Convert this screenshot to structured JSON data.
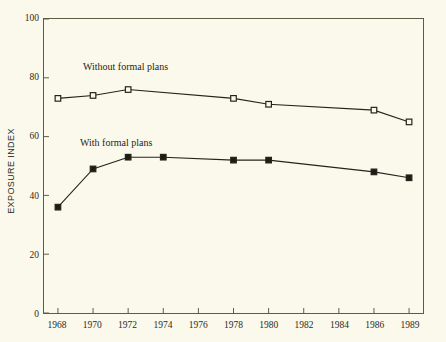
{
  "chart_data": {
    "type": "line",
    "title": "",
    "xlabel": "",
    "ylabel": "EXPOSURE INDEX",
    "xlim": [
      1968,
      1989
    ],
    "ylim": [
      0,
      100
    ],
    "grid": false,
    "legend_position": "inline-annotation",
    "x_tick_labels": [
      "1968",
      "1970",
      "1972",
      "1974",
      "1976",
      "1978",
      "1980",
      "1982",
      "1984",
      "1986",
      "1989"
    ],
    "y_tick_labels": [
      "0",
      "20",
      "40",
      "60",
      "80",
      "100"
    ],
    "y_ticks": [
      0,
      20,
      40,
      60,
      80,
      100
    ],
    "series": [
      {
        "name": "Without formal plans",
        "marker": "open-square",
        "x": [
          1968,
          1970,
          1972,
          1978,
          1980,
          1986,
          1989
        ],
        "values": [
          73,
          74,
          76,
          73,
          71,
          69,
          65
        ]
      },
      {
        "name": "With formal plans",
        "marker": "filled-square",
        "x": [
          1968,
          1970,
          1972,
          1974,
          1978,
          1980,
          1986,
          1989
        ],
        "values": [
          36,
          49,
          53,
          53,
          52,
          52,
          48,
          46
        ]
      }
    ],
    "annotations": [
      {
        "text": "Without formal plans",
        "near_series": "Without formal plans"
      },
      {
        "text": "With formal plans",
        "near_series": "With formal plans"
      }
    ],
    "colors": {
      "background": "#fbf9ec",
      "axis": "#5d5d45",
      "line": "#24241a",
      "marker_fill_open": "#fbf9ec",
      "marker_fill_solid": "#1d1d14",
      "text": "#2b2b20"
    }
  }
}
